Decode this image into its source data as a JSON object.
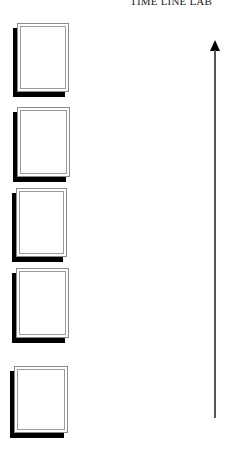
{
  "title": "TIME LINE LAB",
  "frames": [
    {
      "x": 17,
      "y": 23,
      "w": 52,
      "h": 69
    },
    {
      "x": 17,
      "y": 107,
      "w": 53,
      "h": 70
    },
    {
      "x": 16,
      "y": 188,
      "w": 51,
      "h": 69
    },
    {
      "x": 16,
      "y": 268,
      "w": 53,
      "h": 70
    },
    {
      "x": 14,
      "y": 366,
      "w": 54,
      "h": 67
    }
  ],
  "axis": {
    "direction": "up",
    "top": 40,
    "bottom": 418,
    "color": "#000000"
  }
}
